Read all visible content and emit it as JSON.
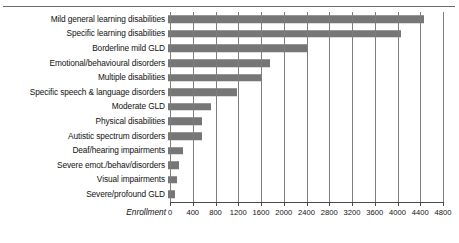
{
  "figure": {
    "top_rule_present": true,
    "bar_color": "#767676",
    "gridline_color": "#7d7d7d",
    "axis_color": "#4a4a4a"
  },
  "chart_data": {
    "type": "bar",
    "orientation": "horizontal",
    "title": "",
    "xlabel": "Enrollment",
    "ylabel": "",
    "xlim": [
      0,
      4800
    ],
    "xticks": [
      0,
      400,
      800,
      1200,
      1600,
      2000,
      2400,
      2800,
      3200,
      3600,
      4000,
      4400,
      4800
    ],
    "xtick_labels": [
      "0",
      "400",
      "800",
      "1200",
      "1600",
      "2000",
      "2400",
      "2800",
      "3200",
      "3600",
      "4000",
      "4400",
      "4800"
    ],
    "grid": "vertical",
    "legend": "none",
    "categories": [
      "Mild general learning disabilities",
      "Specific learning disabilities",
      "Borderline mild GLD",
      "Emotional/behavioural disorders",
      "Multiple disabilities",
      "Specific speech & language disorders",
      "Moderate GLD",
      "Physical disabilities",
      "Autistic spectrum disorders",
      "Deaf/hearing impairments",
      "Severe emot./behav/disorders",
      "Visual impairments",
      "Severe/profound GLD"
    ],
    "values": [
      4500,
      4100,
      2450,
      1800,
      1650,
      1220,
      760,
      590,
      600,
      270,
      200,
      160,
      130
    ]
  }
}
